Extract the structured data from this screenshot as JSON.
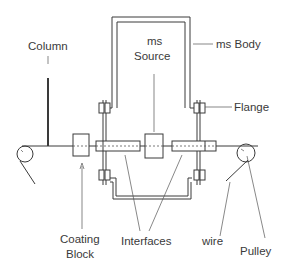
{
  "diagram": {
    "type": "schematic",
    "labels": {
      "column": "Column",
      "ms_source_line1": "ms",
      "ms_source_line2": "Source",
      "ms_body": "ms Body",
      "flange": "Flange",
      "coating_block_line1": "Coating",
      "coating_block_line2": "Block",
      "interfaces": "Interfaces",
      "wire": "wire",
      "pulley": "Pulley"
    },
    "colors": {
      "line": "#3a3a3a",
      "background": "#ffffff"
    }
  }
}
